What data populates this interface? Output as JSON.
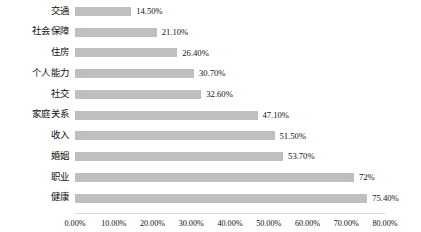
{
  "chart_data": {
    "type": "bar",
    "orientation": "horizontal",
    "title": "",
    "subtitle": "",
    "xlabel": "",
    "ylabel": "",
    "categories": [
      "交通",
      "社会保障",
      "住房",
      "个人能力",
      "社交",
      "家庭关系",
      "收入",
      "婚姻",
      "职业",
      "健康"
    ],
    "values": [
      14.5,
      21.1,
      26.4,
      30.7,
      32.6,
      47.1,
      51.5,
      53.7,
      72,
      75.4
    ],
    "value_labels": [
      "14.50%",
      "21.10%",
      "26.40%",
      "30.70%",
      "32.60%",
      "47.10%",
      "51.50%",
      "53.70%",
      "72%",
      "75.40%"
    ],
    "xlim": [
      0,
      80
    ],
    "xticks": [
      0,
      10,
      20,
      30,
      40,
      50,
      60,
      70,
      80
    ],
    "xtick_labels": [
      "0.00%",
      "10.00%",
      "20.00%",
      "30.00%",
      "40.00%",
      "50.00%",
      "60.00%",
      "70.00%",
      "80.00%"
    ],
    "grid": false,
    "legend": false,
    "bar_color": "#bfbfbf",
    "axis_color": "#d9d9d9",
    "text_color": "#111111"
  }
}
